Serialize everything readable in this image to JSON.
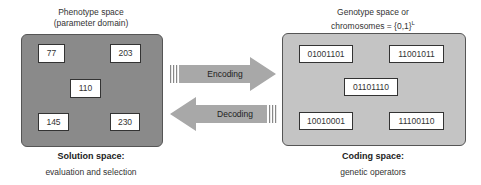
{
  "phenotype": {
    "title_line1": "Phenotype space",
    "title_line2": "(parameter domain)",
    "values": [
      "77",
      "203",
      "110",
      "145",
      "230"
    ],
    "footer_title": "Solution space:",
    "footer_sub": "evaluation and selection",
    "fill_color": "#8a8a8a"
  },
  "genotype": {
    "title_line1": "Genotype space or",
    "title_line2": "chromosomes = {0,1}",
    "title_sup": "L",
    "values": [
      "01001101",
      "11001011",
      "01101110",
      "10010001",
      "11100110"
    ],
    "footer_title": "Coding space:",
    "footer_sub": "genetic operators",
    "fill_color": "#c4c4c4"
  },
  "arrows": {
    "encoding_label": "Encoding",
    "decoding_label": "Decoding",
    "arrow_color": "#a8a8a8"
  }
}
